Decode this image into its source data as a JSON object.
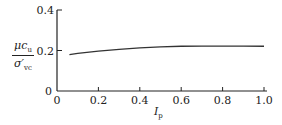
{
  "chart_data": {
    "type": "line",
    "title": "",
    "xlabel": "I_p",
    "ylabel": "μc_u / σ'_vc",
    "xlim": [
      0,
      1.0
    ],
    "ylim": [
      0,
      0.4
    ],
    "x_ticks": [
      "0",
      "0.2",
      "0.4",
      "0.6",
      "0.8",
      "1.0"
    ],
    "y_ticks": [
      "0",
      "0.2",
      "0.4"
    ],
    "grid": false,
    "legend": null,
    "series": [
      {
        "name": "μc_u/σ'_vc vs I_p",
        "x": [
          0.06,
          0.1,
          0.2,
          0.3,
          0.4,
          0.5,
          0.6,
          0.7,
          0.8,
          0.9,
          1.0
        ],
        "values": [
          0.18,
          0.186,
          0.197,
          0.206,
          0.213,
          0.218,
          0.221,
          0.222,
          0.222,
          0.222,
          0.221
        ]
      }
    ]
  },
  "labels": {
    "y_num": "μc",
    "y_num_sub": "u",
    "y_den": "σ′",
    "y_den_sub": "vc",
    "x_main": "I",
    "x_sub": "p"
  }
}
